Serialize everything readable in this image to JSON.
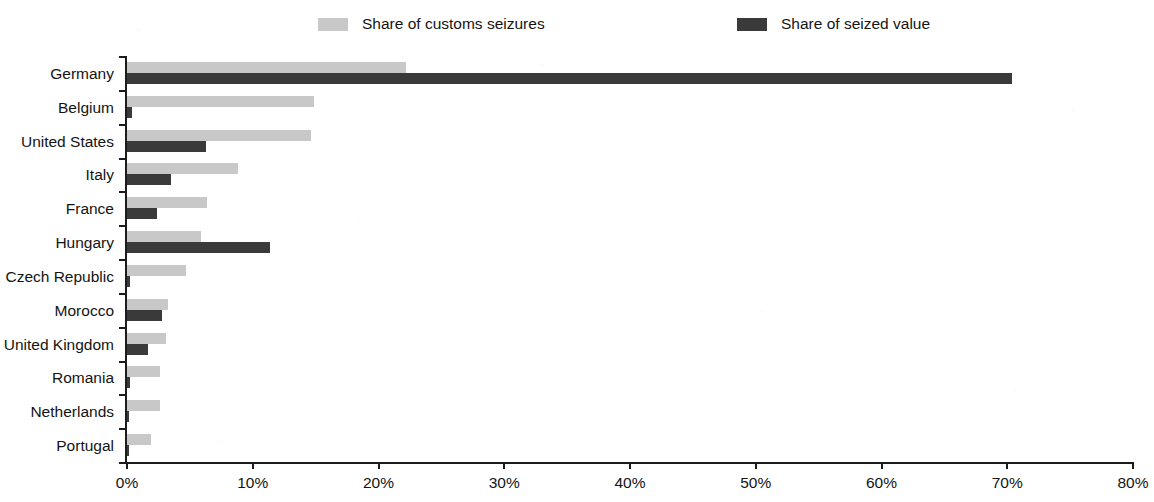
{
  "chart_data": {
    "type": "bar",
    "orientation": "horizontal",
    "title": "",
    "subtitle": "",
    "xlabel": "",
    "ylabel": "",
    "xlim": [
      0,
      80
    ],
    "xtick_values": [
      0,
      10,
      20,
      30,
      40,
      50,
      60,
      70,
      80
    ],
    "xtick_labels": [
      "0%",
      "10%",
      "20%",
      "30%",
      "40%",
      "50%",
      "60%",
      "70%",
      "80%"
    ],
    "grid": false,
    "legend_position": "top",
    "categories": [
      "Germany",
      "Belgium",
      "United States",
      "Italy",
      "France",
      "Hungary",
      "Czech Republic",
      "Morocco",
      "United Kingdom",
      "Romania",
      "Netherlands",
      "Portugal"
    ],
    "series": [
      {
        "name": "Share of customs seizures",
        "color": "#c8c8c8",
        "values": [
          22.2,
          14.9,
          14.6,
          8.8,
          6.4,
          5.9,
          4.7,
          3.3,
          3.1,
          2.6,
          2.6,
          1.9
        ]
      },
      {
        "name": "Share of seized value",
        "color": "#3a3a3a",
        "values": [
          70.4,
          0.4,
          6.3,
          3.5,
          2.4,
          11.4,
          0.2,
          2.8,
          1.7,
          0.2,
          0.1,
          0.1
        ]
      }
    ]
  },
  "legend": {
    "items": [
      {
        "label": "Share of customs seizures",
        "color": "#c8c8c8",
        "x": 318
      },
      {
        "label": "Share of seized value",
        "color": "#3a3a3a",
        "x": 737
      }
    ]
  }
}
